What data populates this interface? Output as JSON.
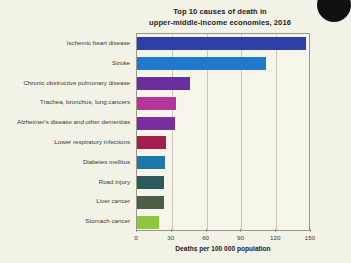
{
  "chart_data": {
    "type": "bar",
    "orientation": "horizontal",
    "title": "Top 10 causes of death in upper-middle-income economies, 2016",
    "title_lines": [
      "Top 10 causes of death in",
      "upper-middle-income economies, 2016"
    ],
    "xlabel": "Deaths per 100 000 population",
    "ylabel": "",
    "xlim": [
      0,
      150
    ],
    "xticks": [
      0,
      30,
      60,
      90,
      120,
      150
    ],
    "grid": "vertical",
    "legend": "none",
    "categories": [
      "Ischemic heart disease",
      "Stroke",
      "Chronic obstructive pulmonary disease",
      "Trachea, bronchus, lung cancers",
      "Alzheimer's disease and other dementias",
      "Lower respiratory infections",
      "Diabetes mellitus",
      "Road injury",
      "Liver cancer",
      "Stomach cancer"
    ],
    "values": [
      146,
      111,
      46,
      34,
      33,
      25,
      24,
      23,
      23,
      19
    ],
    "colors": [
      "#2f3fa8",
      "#2079cf",
      "#6a2f9c",
      "#b5359a",
      "#7a2fa0",
      "#a41d4e",
      "#1b7aa8",
      "#2c5a5b",
      "#4c5f43",
      "#8dc63f"
    ]
  },
  "figure": {
    "background_color": "#f3f2e7",
    "plot_background_color": "#f6f5ea",
    "axis_color": "#9a978c",
    "gridline_color": "#c9c6b8",
    "text_color": "#23211c"
  },
  "artifacts": {
    "corner_blob_name": "scan-edge-blob"
  }
}
